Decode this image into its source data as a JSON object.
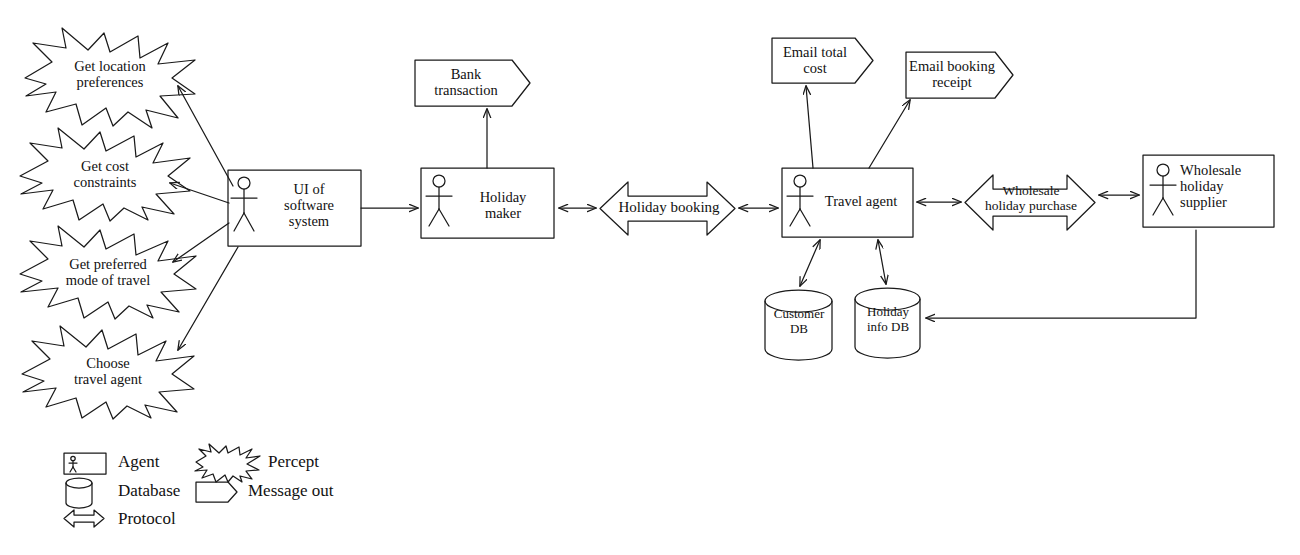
{
  "diagram": {
    "type": "agent-uml-diagram",
    "stroke_color": "#1a1a1a",
    "fill_color": "#ffffff"
  },
  "percepts": [
    {
      "id": "percept-location",
      "label": "Get location\npreferences",
      "x": 25,
      "y": 28,
      "w": 170,
      "h": 100
    },
    {
      "id": "percept-cost",
      "label": "Get cost\nconstraints",
      "x": 20,
      "y": 128,
      "w": 170,
      "h": 92
    },
    {
      "id": "percept-mode",
      "label": "Get preferred\nmode of travel",
      "x": 20,
      "y": 226,
      "w": 176,
      "h": 92
    },
    {
      "id": "percept-choose",
      "label": "Choose\ntravel agent",
      "x": 22,
      "y": 326,
      "w": 172,
      "h": 92
    }
  ],
  "agents": [
    {
      "id": "agent-ui",
      "label": "UI of\nsoftware\nsystem",
      "x": 228,
      "y": 170,
      "w": 133,
      "h": 76
    },
    {
      "id": "agent-holiday-maker",
      "label": "Holiday\nmaker",
      "x": 421,
      "y": 168,
      "w": 133,
      "h": 70
    },
    {
      "id": "agent-travel",
      "label": "Travel agent",
      "x": 782,
      "y": 168,
      "w": 131,
      "h": 69
    },
    {
      "id": "agent-supplier",
      "label": "Wholesale\nholiday\nsupplier",
      "x": 1143,
      "y": 155,
      "w": 131,
      "h": 72
    }
  ],
  "messages": [
    {
      "id": "msg-bank",
      "label": "Bank\ntransaction",
      "x": 415,
      "y": 60,
      "w": 115,
      "h": 46
    },
    {
      "id": "msg-email-total",
      "label": "Email total\ncost",
      "x": 772,
      "y": 38,
      "w": 101,
      "h": 45
    },
    {
      "id": "msg-email-receipt",
      "label": "Email booking\nreceipt",
      "x": 906,
      "y": 52,
      "w": 107,
      "h": 46
    }
  ],
  "protocols": [
    {
      "id": "proto-holiday-booking",
      "label": "Holiday booking",
      "x": 600,
      "y": 182,
      "w": 135,
      "h": 53
    },
    {
      "id": "proto-wholesale",
      "label": "Wholesale\nholiday purchase",
      "x": 965,
      "y": 175,
      "w": 130,
      "h": 55
    }
  ],
  "databases": [
    {
      "id": "db-customer",
      "label": "Customer\nDB",
      "x": 765,
      "y": 290,
      "w": 67,
      "h": 70
    },
    {
      "id": "db-holiday",
      "label": "Holiday\ninfo DB",
      "x": 855,
      "y": 288,
      "w": 65,
      "h": 70
    }
  ],
  "legend": {
    "items": [
      {
        "id": "legend-agent",
        "label": "Agent",
        "symbol": "agent-box-icon"
      },
      {
        "id": "legend-database",
        "label": "Database",
        "symbol": "database-cylinder-icon"
      },
      {
        "id": "legend-protocol",
        "label": "Protocol",
        "symbol": "double-arrow-icon"
      },
      {
        "id": "legend-percept",
        "label": "Percept",
        "symbol": "starburst-icon"
      },
      {
        "id": "legend-message",
        "label": "Message out",
        "symbol": "message-pentagon-icon"
      }
    ]
  },
  "connections": [
    {
      "from": "agent-ui",
      "to": "percept-location",
      "kind": "arrow-single"
    },
    {
      "from": "agent-ui",
      "to": "percept-cost",
      "kind": "arrow-single"
    },
    {
      "from": "agent-ui",
      "to": "percept-mode",
      "kind": "arrow-single"
    },
    {
      "from": "agent-ui",
      "to": "percept-choose",
      "kind": "arrow-single"
    },
    {
      "from": "agent-ui",
      "to": "agent-holiday-maker",
      "kind": "arrow-single"
    },
    {
      "from": "agent-holiday-maker",
      "to": "msg-bank",
      "kind": "arrow-single"
    },
    {
      "from": "agent-holiday-maker",
      "to": "proto-holiday-booking",
      "kind": "arrow-double"
    },
    {
      "from": "proto-holiday-booking",
      "to": "agent-travel",
      "kind": "arrow-double"
    },
    {
      "from": "agent-travel",
      "to": "msg-email-total",
      "kind": "arrow-single"
    },
    {
      "from": "agent-travel",
      "to": "msg-email-receipt",
      "kind": "arrow-single"
    },
    {
      "from": "agent-travel",
      "to": "db-customer",
      "kind": "arrow-double"
    },
    {
      "from": "agent-travel",
      "to": "db-holiday",
      "kind": "arrow-double"
    },
    {
      "from": "agent-travel",
      "to": "proto-wholesale",
      "kind": "arrow-double"
    },
    {
      "from": "proto-wholesale",
      "to": "agent-supplier",
      "kind": "arrow-double"
    },
    {
      "from": "agent-supplier",
      "to": "db-holiday",
      "kind": "arrow-single"
    }
  ]
}
